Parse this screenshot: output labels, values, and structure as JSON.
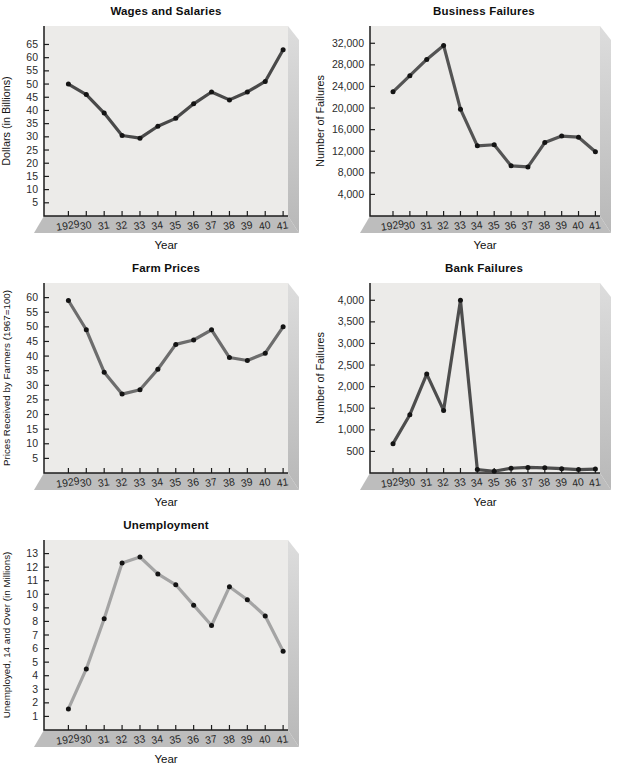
{
  "colors": {
    "page_bg": "#ffffff",
    "plot_face": "#ecebe9",
    "slab_side_top": "#dddddd",
    "slab_side_bottom": "#b8b8b8",
    "slab_bottom": "#bdbdbd",
    "axis": "#1c1c1c"
  },
  "chart_data": [
    {
      "type": "line",
      "title": "Wages and Salaries",
      "xlabel": "Year",
      "ylabel": "Dollars (in Billions)",
      "categories": [
        "1929",
        "30",
        "31",
        "32",
        "33",
        "34",
        "35",
        "36",
        "37",
        "38",
        "39",
        "40",
        "41"
      ],
      "values": [
        50,
        46,
        39,
        30.5,
        29.5,
        34,
        37,
        42.5,
        47,
        44,
        47,
        51,
        63
      ],
      "yticks": [
        5,
        10,
        15,
        20,
        25,
        30,
        35,
        40,
        45,
        50,
        55,
        60,
        65
      ],
      "ytick_labels": [
        "5",
        "10",
        "15",
        "20",
        "25",
        "30",
        "35",
        "40",
        "45",
        "50",
        "55",
        "60",
        "65"
      ],
      "ylim": [
        0,
        72
      ],
      "grid": false,
      "legend": "none",
      "line_color": "#494949",
      "dot_color": "#141414"
    },
    {
      "type": "line",
      "title": "Business Failures",
      "xlabel": "Year",
      "ylabel": "Number of Failures",
      "categories": [
        "1929",
        "30",
        "31",
        "32",
        "33",
        "34",
        "35",
        "36",
        "37",
        "38",
        "39",
        "40",
        "41"
      ],
      "values": [
        23000,
        26000,
        29000,
        31600,
        19800,
        13000,
        13200,
        9300,
        9100,
        13600,
        14800,
        14600,
        11900
      ],
      "yticks": [
        4000,
        8000,
        12000,
        16000,
        20000,
        24000,
        28000,
        32000
      ],
      "ytick_labels": [
        "4,000",
        "8,000",
        "12,000",
        "16,000",
        "20,000",
        "24,000",
        "28,000",
        "32,000"
      ],
      "ylim": [
        0,
        35200
      ],
      "grid": false,
      "legend": "none",
      "line_color": "#545454",
      "dot_color": "#141414"
    },
    {
      "type": "line",
      "title": "Farm Prices",
      "xlabel": "Year",
      "ylabel": "Prices Received by Farmers (1967=100)",
      "categories": [
        "1929",
        "30",
        "31",
        "32",
        "33",
        "34",
        "35",
        "36",
        "37",
        "38",
        "39",
        "40",
        "41"
      ],
      "values": [
        59,
        49,
        34.5,
        27,
        28.5,
        35.5,
        44,
        45.5,
        49,
        39.5,
        38.5,
        41,
        50
      ],
      "yticks": [
        5,
        10,
        15,
        20,
        25,
        30,
        35,
        40,
        45,
        50,
        55,
        60
      ],
      "ytick_labels": [
        "5",
        "10",
        "15",
        "20",
        "25",
        "30",
        "35",
        "40",
        "45",
        "50",
        "55",
        "60"
      ],
      "ylim": [
        0,
        65
      ],
      "grid": false,
      "legend": "none",
      "line_color": "#6d6d6d",
      "dot_color": "#141414"
    },
    {
      "type": "line",
      "title": "Bank Failures",
      "xlabel": "Year",
      "ylabel": "Number of Failures",
      "categories": [
        "1929",
        "30",
        "31",
        "32",
        "33",
        "34",
        "35",
        "36",
        "37",
        "38",
        "39",
        "40",
        "41"
      ],
      "values": [
        680,
        1350,
        2290,
        1450,
        4000,
        80,
        40,
        110,
        130,
        120,
        100,
        80,
        90
      ],
      "yticks": [
        500,
        1000,
        1500,
        2000,
        2500,
        3000,
        3500,
        4000
      ],
      "ytick_labels": [
        "500",
        "1,000",
        "1,500",
        "2,000",
        "2,500",
        "3,000",
        "3,500",
        "4,000"
      ],
      "ylim": [
        0,
        4400
      ],
      "grid": false,
      "legend": "none",
      "line_color": "#4d4d4d",
      "dot_color": "#141414"
    },
    {
      "type": "line",
      "title": "Unemployment",
      "xlabel": "Year",
      "ylabel": "Unemployed, 14 and Over (in Millions)",
      "categories": [
        "1929",
        "30",
        "31",
        "32",
        "33",
        "34",
        "35",
        "36",
        "37",
        "38",
        "39",
        "40",
        "41"
      ],
      "values": [
        1.55,
        4.5,
        8.2,
        12.3,
        12.75,
        11.5,
        10.7,
        9.2,
        7.7,
        10.55,
        9.6,
        8.4,
        5.8
      ],
      "yticks": [
        1,
        2,
        3,
        4,
        5,
        6,
        7,
        8,
        9,
        10,
        11,
        12,
        13
      ],
      "ytick_labels": [
        "1",
        "2",
        "3",
        "4",
        "5",
        "6",
        "7",
        "8",
        "9",
        "10",
        "11",
        "12",
        "13"
      ],
      "ylim": [
        0,
        14
      ],
      "grid": false,
      "legend": "none",
      "line_color": "#a4a4a4",
      "dot_color": "#141414"
    }
  ]
}
